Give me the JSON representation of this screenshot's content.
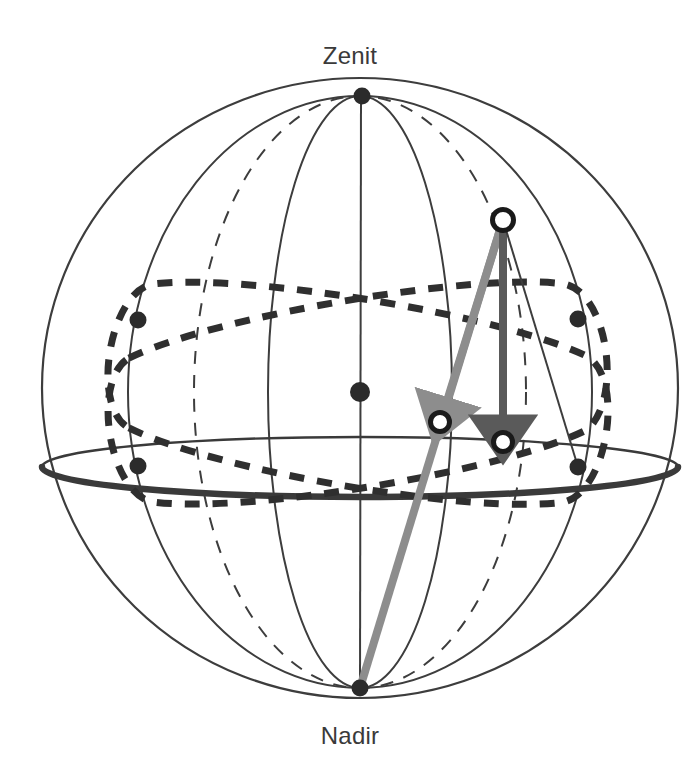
{
  "diagram": {
    "labels": {
      "zenith": "Zenit",
      "nadir": "Nadir"
    },
    "colors": {
      "outline": "#3d3d3d",
      "horizon_thick": "#3a3a3a",
      "dashed_circle": "#2f2f2f",
      "gray_arrow": "#8d8d8d",
      "dark_arrow": "#5a5a5a",
      "marker_fill": "#2b2b2b",
      "open_marker_stroke": "#1a1a1a",
      "background": "#ffffff",
      "text": "#3a3a3a"
    },
    "geometry": {
      "sphere_center_x": 360,
      "sphere_center_y": 388,
      "sphere_radius_x": 318,
      "sphere_radius_y": 310,
      "horizon_center_y": 467,
      "horizon_radius_y": 30
    },
    "points": [
      {
        "name": "zenith",
        "x": 362,
        "y": 96,
        "type": "filled"
      },
      {
        "name": "nadir",
        "x": 360,
        "y": 688,
        "type": "filled"
      },
      {
        "name": "center",
        "x": 360,
        "y": 392,
        "type": "filled"
      },
      {
        "name": "west-upper",
        "x": 138,
        "y": 320,
        "type": "filled"
      },
      {
        "name": "east-upper",
        "x": 578,
        "y": 319,
        "type": "filled"
      },
      {
        "name": "west-horizon",
        "x": 138,
        "y": 466,
        "type": "filled"
      },
      {
        "name": "east-horizon",
        "x": 578,
        "y": 467,
        "type": "filled"
      },
      {
        "name": "star",
        "x": 503,
        "y": 220,
        "type": "open"
      },
      {
        "name": "gray-arrow-target",
        "x": 440,
        "y": 422,
        "type": "open"
      },
      {
        "name": "dark-arrow-target",
        "x": 503,
        "y": 442,
        "type": "open"
      }
    ],
    "arrows": [
      {
        "name": "gray-projection-arrow",
        "from_x": 503,
        "from_y": 220,
        "to_x": 441,
        "to_y": 419,
        "color": "#8d8d8d"
      },
      {
        "name": "dark-vertical-arrow",
        "from_x": 503,
        "from_y": 220,
        "to_x": 503,
        "to_y": 438,
        "color": "#5a5a5a"
      }
    ]
  }
}
